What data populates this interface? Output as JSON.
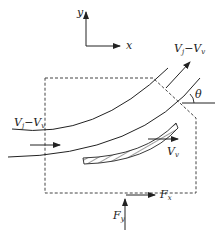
{
  "diagram": {
    "type": "free-body / control-volume diagram of jet on moving curved vane",
    "axes": {
      "x_label": "x",
      "y_label": "y"
    },
    "labels": {
      "inlet_velocity": {
        "main": "V",
        "sub1": "j",
        "minus": "−",
        "main2": "V",
        "sub2": "v"
      },
      "outlet_velocity": {
        "main": "V",
        "sub1": "j",
        "minus": "−",
        "main2": "V",
        "sub2": "v"
      },
      "angle": "θ",
      "vane_velocity": {
        "main": "V",
        "sub": "v"
      },
      "force_x": {
        "main": "F",
        "sub": "x"
      },
      "force_y": {
        "main": "F",
        "sub": "y"
      }
    },
    "colors": {
      "stroke": "#222222",
      "background": "#ffffff"
    }
  }
}
